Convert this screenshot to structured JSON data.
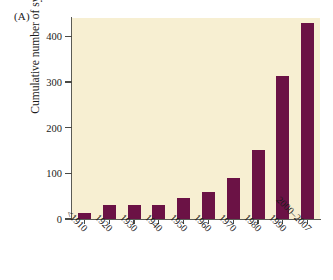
{
  "figure": {
    "panel_label": "(A)",
    "background_color": "#ffffff",
    "plot_background_color": "#f7efd2",
    "bar_color": "#6b1245",
    "axis_color": "#5b5b55"
  },
  "chart_data": {
    "type": "bar",
    "title": "(A)",
    "xlabel": "",
    "ylabel": "Cumulative number of systems",
    "categories": [
      "<1910",
      "1920",
      "1930",
      "1940",
      "1950",
      "1960",
      "1970",
      "1980",
      "1990",
      "2000–2007"
    ],
    "values": [
      14,
      30,
      30,
      30,
      45,
      60,
      90,
      152,
      313,
      428
    ],
    "ylim": [
      0,
      440
    ],
    "yticks": [
      0,
      100,
      200,
      300,
      400
    ],
    "ytick_labels": [
      "0",
      "100",
      "200",
      "300",
      "400"
    ],
    "grid": false,
    "legend": null,
    "series": [
      {
        "name": "Cumulative number of systems",
        "values": [
          14,
          30,
          30,
          30,
          45,
          60,
          90,
          152,
          313,
          428
        ],
        "color": "#6b1245"
      }
    ]
  }
}
